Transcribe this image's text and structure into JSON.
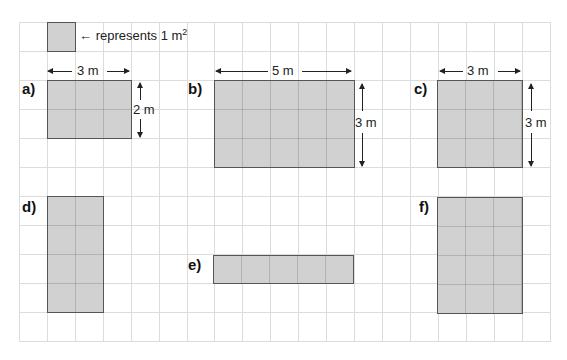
{
  "colors": {
    "fill": "#d1d1d1",
    "border": "#555555",
    "grid": "#dcdcdc"
  },
  "grid": {
    "cols": 19,
    "rows": 11,
    "cell_width": 28,
    "cell_height": 29
  },
  "key": {
    "arrow": "←",
    "text": "represents 1 m",
    "superscript": "2"
  },
  "shapes": [
    {
      "id": "a",
      "label": "a)",
      "width_label": "3 m",
      "height_label": "2 m",
      "cols": 3,
      "rows": 2
    },
    {
      "id": "b",
      "label": "b)",
      "width_label": "5 m",
      "height_label": "3 m",
      "cols": 5,
      "rows": 3
    },
    {
      "id": "c",
      "label": "c)",
      "width_label": "3 m",
      "height_label": "3 m",
      "cols": 3,
      "rows": 3
    },
    {
      "id": "d",
      "label": "d)",
      "cols": 2,
      "rows": 4
    },
    {
      "id": "e",
      "label": "e)",
      "cols": 5,
      "rows": 1
    },
    {
      "id": "f",
      "label": "f)",
      "cols": 3,
      "rows": 4
    }
  ]
}
